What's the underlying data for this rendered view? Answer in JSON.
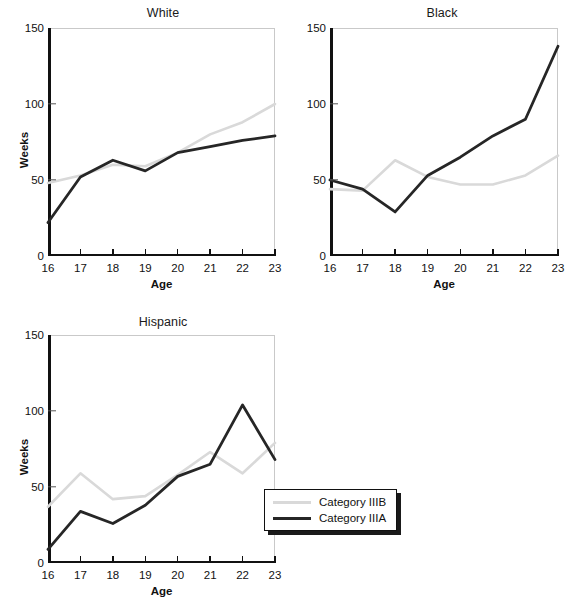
{
  "figure": {
    "legend": {
      "entries": [
        {
          "label": "Category IIIB",
          "color": "#d9d9d9"
        },
        {
          "label": "Category IIIA",
          "color": "#262626"
        }
      ]
    }
  },
  "chart_data": [
    {
      "type": "line",
      "title": "White",
      "xlabel": "Age",
      "ylabel": "Weeks",
      "x": [
        16,
        17,
        18,
        19,
        20,
        21,
        22,
        23
      ],
      "xticklabels": [
        "16",
        "17",
        "18",
        "19",
        "20",
        "21",
        "22",
        "23"
      ],
      "yticks": [
        0,
        50,
        100,
        150
      ],
      "yticklabels": [
        "0",
        "50",
        "100",
        "150"
      ],
      "xlim": [
        16,
        23
      ],
      "ylim": [
        0,
        150
      ],
      "grid": false,
      "series": [
        {
          "name": "Category IIIB",
          "color": "#d9d9d9",
          "values": [
            48,
            53,
            60,
            59,
            68,
            80,
            88,
            100
          ]
        },
        {
          "name": "Category IIIA",
          "color": "#262626",
          "values": [
            22,
            52,
            63,
            56,
            68,
            72,
            76,
            79
          ]
        }
      ]
    },
    {
      "type": "line",
      "title": "Black",
      "xlabel": "Age",
      "ylabel": "",
      "x": [
        16,
        17,
        18,
        19,
        20,
        21,
        22,
        23
      ],
      "xticklabels": [
        "16",
        "17",
        "18",
        "19",
        "20",
        "21",
        "22",
        "23"
      ],
      "yticks": [
        0,
        50,
        100,
        150
      ],
      "yticklabels": [
        "0",
        "50",
        "100",
        "150"
      ],
      "xlim": [
        16,
        23
      ],
      "ylim": [
        0,
        150
      ],
      "grid": false,
      "series": [
        {
          "name": "Category IIIB",
          "color": "#d9d9d9",
          "values": [
            44,
            43,
            63,
            52,
            47,
            47,
            53,
            66
          ]
        },
        {
          "name": "Category IIIA",
          "color": "#262626",
          "values": [
            50,
            44,
            29,
            53,
            65,
            79,
            90,
            138
          ]
        }
      ]
    },
    {
      "type": "line",
      "title": "Hispanic",
      "xlabel": "Age",
      "ylabel": "Weeks",
      "x": [
        16,
        17,
        18,
        19,
        20,
        21,
        22,
        23
      ],
      "xticklabels": [
        "16",
        "17",
        "18",
        "19",
        "20",
        "21",
        "22",
        "23"
      ],
      "yticks": [
        0,
        50,
        100,
        150
      ],
      "yticklabels": [
        "0",
        "50",
        "100",
        "150"
      ],
      "xlim": [
        16,
        23
      ],
      "ylim": [
        0,
        150
      ],
      "grid": false,
      "series": [
        {
          "name": "Category IIIB",
          "color": "#d9d9d9",
          "values": [
            37,
            59,
            42,
            44,
            58,
            73,
            59,
            79
          ]
        },
        {
          "name": "Category IIIA",
          "color": "#262626",
          "values": [
            9,
            34,
            26,
            38,
            57,
            65,
            104,
            68
          ]
        }
      ]
    }
  ]
}
